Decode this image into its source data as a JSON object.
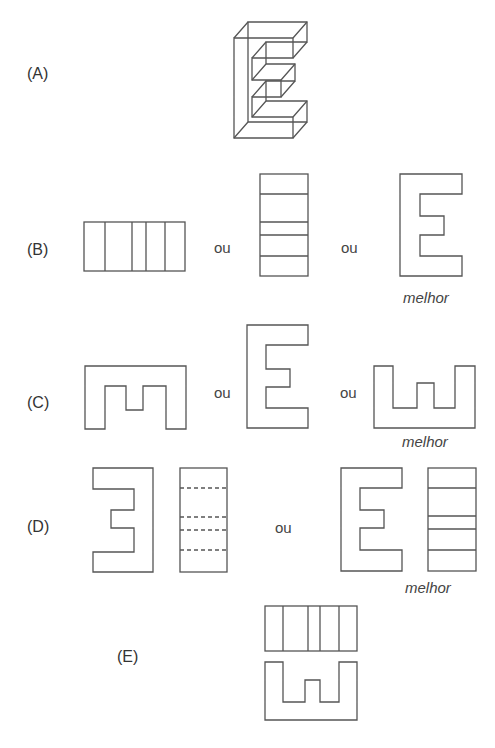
{
  "figure": {
    "panels": [
      {
        "id": "A",
        "label": "(A)",
        "description": "3D wireframe letter E"
      },
      {
        "id": "B",
        "label": "(B)",
        "options": [
          "5-column rectangle",
          "5-row rectangle",
          "E shape"
        ],
        "separators": [
          "ou",
          "ou"
        ],
        "best_caption": "melhor"
      },
      {
        "id": "C",
        "label": "(C)",
        "options": [
          "upside-down m shape",
          "E shape",
          "omega (ш) shape"
        ],
        "separators": [
          "ou",
          "ou"
        ],
        "best_caption": "melhor"
      },
      {
        "id": "D",
        "label": "(D)",
        "options": [
          "mirrored E + dashed-row rectangle",
          "E + solid-row rectangle"
        ],
        "separators": [
          "ou"
        ],
        "best_caption": "melhor"
      },
      {
        "id": "E",
        "label": "(E)",
        "options": [
          "5-column rectangle above ш shape"
        ]
      }
    ],
    "stroke_color": "#555555",
    "background": "#ffffff"
  }
}
